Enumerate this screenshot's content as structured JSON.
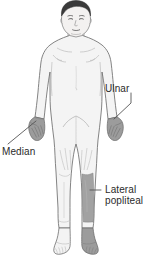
{
  "figure": {
    "background_color": "#ffffff",
    "outline_color": "#6e6e6e",
    "skin_fill_color": "#f4f4f4",
    "shaded_region_color": "#9b9b9b",
    "hair_color": "#3a3a3a",
    "label_text_color": "#2b2b2b",
    "leader_line_color": "#555555"
  },
  "labels": [
    {
      "id": "ulnar",
      "text": "Ulnar",
      "lines": [
        "Ulnar"
      ],
      "points_to": "left-hand-shaded-region",
      "side": "right",
      "x": 105,
      "y": 83
    },
    {
      "id": "median",
      "text": "Median",
      "lines": [
        "Median"
      ],
      "points_to": "right-hand-shaded-region",
      "side": "left",
      "x": 2,
      "y": 146
    },
    {
      "id": "lateral-popliteal",
      "text": "Lateral popliteal",
      "lines": [
        "Lateral",
        "popliteal"
      ],
      "points_to": "left-lower-leg-shaded-region",
      "side": "right",
      "x": 105,
      "y": 184
    }
  ],
  "shaded_regions": [
    {
      "id": "right-hand",
      "name": "Right hand (viewer left)",
      "nerve": "Median"
    },
    {
      "id": "left-hand",
      "name": "Left hand (viewer right)",
      "nerve": "Ulnar"
    },
    {
      "id": "left-lower-leg",
      "name": "Left lower leg and foot (viewer right)",
      "nerve": "Lateral popliteal"
    }
  ]
}
